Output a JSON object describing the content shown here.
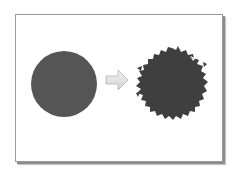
{
  "diagram": {
    "elements": [
      {
        "id": "original-circle",
        "shape": "circle",
        "cx": 64,
        "cy": 84,
        "r": 33,
        "fill": "#555555"
      },
      {
        "id": "transform-arrow",
        "shape": "arrow",
        "direction": "right",
        "fill": "#e2e2e2",
        "stroke": "#b5b5b5"
      },
      {
        "id": "roughened-circle",
        "shape": "roughened-circle",
        "cx": 172,
        "cy": 83,
        "r": 33,
        "fill": "#3f3f3f"
      }
    ]
  },
  "colors": {
    "frame_border": "#9a9a9a",
    "frame_shadow": "#8c8c8c",
    "background": "#ffffff"
  }
}
